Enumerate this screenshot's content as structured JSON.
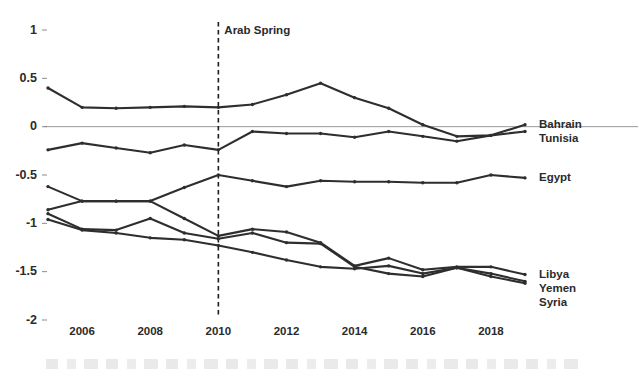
{
  "chart_data": {
    "type": "line",
    "title": "",
    "subtitle": "",
    "xlabel": "",
    "ylabel": "",
    "xlim": [
      2005,
      2019
    ],
    "ylim": [
      -2,
      1
    ],
    "grid": false,
    "legend_position": "right-edge-labels",
    "x": [
      2005,
      2006,
      2007,
      2008,
      2009,
      2010,
      2011,
      2012,
      2013,
      2014,
      2015,
      2016,
      2017,
      2018,
      2019
    ],
    "xtick_labels": [
      "2006",
      "2008",
      "2010",
      "2012",
      "2014",
      "2016",
      "2018"
    ],
    "xtick_values": [
      2006,
      2008,
      2010,
      2012,
      2014,
      2016,
      2018
    ],
    "ytick_labels": [
      "1",
      "0.5",
      "0",
      "-0.5",
      "-1",
      "-1.5",
      "-2"
    ],
    "ytick_values": [
      1,
      0.5,
      0,
      -0.5,
      -1,
      -1.5,
      -2
    ],
    "zero_line": 0,
    "annotations": [
      {
        "name": "arab-spring",
        "label": "Arab Spring",
        "x": 2010,
        "style": "vertical-dashed-line"
      }
    ],
    "series": [
      {
        "name": "Bahrain",
        "label": "Bahrain",
        "color": "#2e2e2e",
        "values": [
          0.4,
          0.2,
          0.19,
          0.2,
          0.21,
          0.2,
          0.23,
          0.33,
          0.45,
          0.3,
          0.19,
          0.02,
          -0.1,
          -0.09,
          0.02
        ]
      },
      {
        "name": "Tunisia",
        "label": "Tunisia",
        "color": "#2e2e2e",
        "values": [
          -0.24,
          -0.17,
          -0.22,
          -0.27,
          -0.19,
          -0.24,
          -0.05,
          -0.07,
          -0.07,
          -0.11,
          -0.05,
          -0.1,
          -0.15,
          -0.09,
          -0.05
        ]
      },
      {
        "name": "Egypt",
        "label": "Egypt",
        "color": "#2e2e2e",
        "values": [
          -0.62,
          -0.77,
          -0.77,
          -0.77,
          -0.63,
          -0.5,
          -0.56,
          -0.62,
          -0.56,
          -0.57,
          -0.57,
          -0.58,
          -0.58,
          -0.5,
          -0.53
        ]
      },
      {
        "name": "Libya",
        "label": "Libya",
        "color": "#2e2e2e",
        "values": [
          -0.86,
          -0.77,
          -0.77,
          -0.77,
          -0.95,
          -1.13,
          -1.06,
          -1.09,
          -1.2,
          -1.44,
          -1.36,
          -1.48,
          -1.45,
          -1.45,
          -1.53
        ]
      },
      {
        "name": "Yemen",
        "label": "Yemen",
        "color": "#2e2e2e",
        "values": [
          -0.9,
          -1.06,
          -1.07,
          -0.95,
          -1.1,
          -1.16,
          -1.1,
          -1.2,
          -1.21,
          -1.45,
          -1.52,
          -1.55,
          -1.46,
          -1.52,
          -1.6
        ]
      },
      {
        "name": "Syria",
        "label": "Syria",
        "color": "#2e2e2e",
        "values": [
          -0.96,
          -1.07,
          -1.1,
          -1.15,
          -1.17,
          -1.23,
          -1.3,
          -1.38,
          -1.45,
          -1.47,
          -1.44,
          -1.52,
          -1.46,
          -1.55,
          -1.62
        ]
      }
    ]
  }
}
